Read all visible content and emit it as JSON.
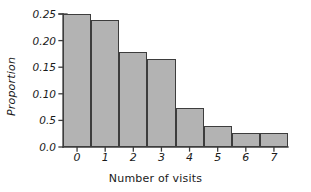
{
  "chart_data": {
    "type": "bar",
    "title": "",
    "subtitle": "",
    "xlabel": "Number of visits",
    "ylabel": "Proportion",
    "categories": [
      "0",
      "1",
      "2",
      "3",
      "4",
      "5",
      "6",
      "7"
    ],
    "values": [
      0.25,
      0.238,
      0.178,
      0.165,
      0.073,
      0.039,
      0.026,
      0.026
    ],
    "series": [
      {
        "name": "Proportion",
        "values": [
          0.25,
          0.238,
          0.178,
          0.165,
          0.073,
          0.039,
          0.026,
          0.026
        ]
      }
    ],
    "ylim": [
      0.0,
      0.25
    ],
    "xlim": [
      -0.5,
      7.5
    ],
    "y_ticks": [
      0.0,
      0.05,
      0.1,
      0.15,
      0.2,
      0.25
    ],
    "y_tick_labels": [
      "0.0",
      "0.5",
      "0.10",
      "0.15",
      "0.20",
      "0.25"
    ],
    "x_ticks": [
      0,
      1,
      2,
      3,
      4,
      5,
      6,
      7
    ],
    "x_tick_labels": [
      "0",
      "1",
      "2",
      "3",
      "4",
      "5",
      "6",
      "7"
    ],
    "grid": false,
    "legend": false,
    "legend_position": "none",
    "annotations": [],
    "bar_fill_color": "#b3b3b3",
    "bar_edge_color": "#3d3d3d",
    "axis_color": "#3d3d3d",
    "background_color": "#ffffff"
  },
  "axis": {
    "y_title": "Proportion",
    "x_title": "Number of visits"
  }
}
